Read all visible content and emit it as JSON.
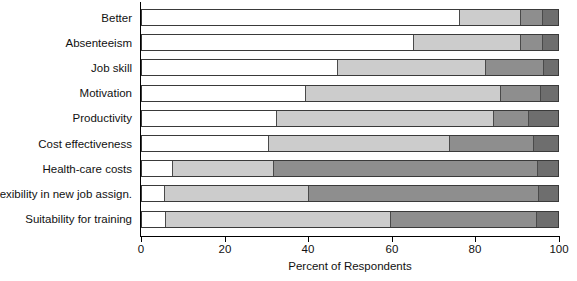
{
  "chart_data": {
    "type": "bar",
    "orientation": "horizontal",
    "stacked": true,
    "title": "",
    "xlabel": "Percent of Respondents",
    "ylabel": "",
    "xlim": [
      0,
      100
    ],
    "xticks": [
      0,
      20,
      40,
      60,
      80,
      100
    ],
    "xticklabels": [
      "0",
      "20",
      "40",
      "60",
      "80",
      "100"
    ],
    "grid": false,
    "legend": "none",
    "categories": [
      "Better",
      "Absenteeism",
      "Job skill",
      "Motivation",
      "Productivity",
      "Cost effectiveness",
      "Health-care costs",
      "Flexibility in new job assign.",
      "Suitability for training"
    ],
    "series": [
      {
        "name": "segment-1",
        "color": "#ffffff",
        "values": [
          76.5,
          65.5,
          47.0,
          39.5,
          32.5,
          30.5,
          7.5,
          5.5,
          5.7
        ]
      },
      {
        "name": "segment-2",
        "color": "#cccccc",
        "values": [
          14.5,
          25.5,
          35.7,
          46.9,
          52.2,
          43.5,
          24.3,
          34.7,
          54.1
        ]
      },
      {
        "name": "segment-3",
        "color": "#8e8e8e",
        "values": [
          5.5,
          5.5,
          13.9,
          9.6,
          8.3,
          20.3,
          63.4,
          55.3,
          35.2
        ]
      },
      {
        "name": "segment-4",
        "color": "#6e6e6e",
        "values": [
          3.5,
          3.5,
          3.4,
          4.0,
          7.0,
          5.7,
          4.8,
          4.5,
          5.0
        ]
      }
    ]
  }
}
